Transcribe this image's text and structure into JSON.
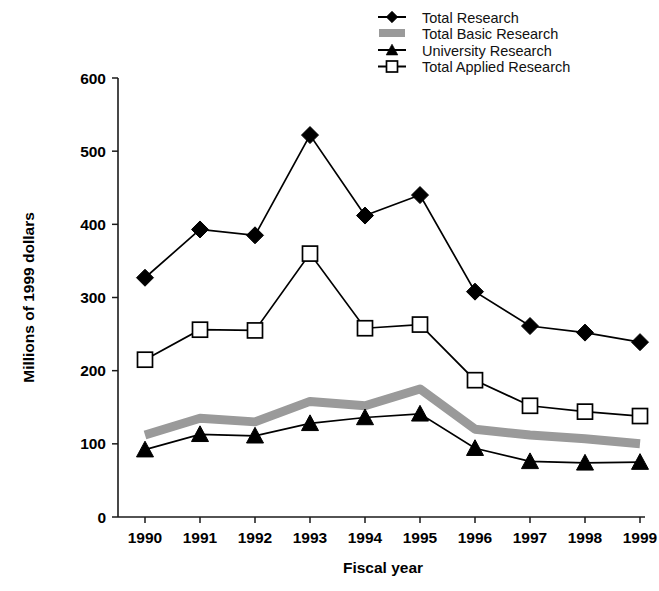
{
  "chart_data": {
    "type": "line",
    "title": "",
    "subtitle": "",
    "xlabel": "Fiscal year",
    "ylabel": "Millions of 1999 dollars",
    "categories": [
      "1990",
      "1991",
      "1992",
      "1993",
      "1994",
      "1995",
      "1996",
      "1997",
      "1998",
      "1999"
    ],
    "x": [
      1990,
      1991,
      1992,
      1993,
      1994,
      1995,
      1996,
      1997,
      1998,
      1999
    ],
    "ylim": [
      0,
      600
    ],
    "yticks": [
      0,
      100,
      200,
      300,
      400,
      500,
      600
    ],
    "ytick_labels": [
      "0",
      "100",
      "200",
      "300",
      "400",
      "500",
      "600"
    ],
    "grid": false,
    "legend_position": "top-right",
    "series": [
      {
        "name": "Total Research",
        "marker": "filled-diamond",
        "color": "#000000",
        "values": [
          327,
          393,
          385,
          522,
          412,
          440,
          308,
          261,
          252,
          239
        ]
      },
      {
        "name": "Total Basic Research",
        "marker": "thick-gray-band",
        "color": "#9a9a9a",
        "values": [
          112,
          135,
          130,
          158,
          152,
          175,
          120,
          112,
          107,
          100
        ]
      },
      {
        "name": "University Research",
        "marker": "filled-triangle",
        "color": "#000000",
        "values": [
          92,
          113,
          111,
          128,
          136,
          141,
          94,
          76,
          74,
          75
        ]
      },
      {
        "name": "Total Applied Research",
        "marker": "open-square",
        "color": "#000000",
        "values": [
          215,
          256,
          255,
          360,
          258,
          263,
          187,
          152,
          144,
          138
        ]
      }
    ],
    "legend": [
      {
        "label": "Total Research",
        "marker": "filled-diamond"
      },
      {
        "label": "Total Basic Research",
        "marker": "thick-gray-band"
      },
      {
        "label": "University Research",
        "marker": "filled-triangle"
      },
      {
        "label": "Total Applied Research",
        "marker": "open-square"
      }
    ]
  },
  "geometry": {
    "plot_left": 118,
    "plot_right": 645,
    "plot_bottom": 517,
    "plot_top": 78,
    "x_first": 145,
    "x_step": 55,
    "legend_x_marker": 392,
    "legend_x_text": 422,
    "legend_y_first": 17,
    "legend_y_step": 16.5
  }
}
